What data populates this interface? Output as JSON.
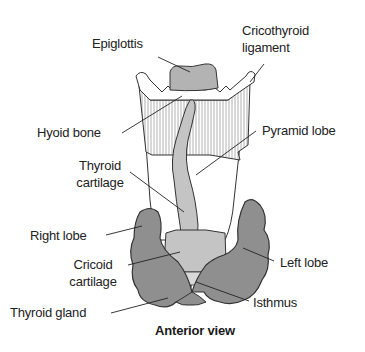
{
  "figure": {
    "view_caption": "Anterior view",
    "colors": {
      "thyroid_gland": "#8f8f8f",
      "cartilage_light": "#c4c4c4",
      "epiglottis": "#b3b3b3",
      "hatching": "#9a9a9a",
      "outline": "#333333",
      "background": "#ffffff"
    }
  },
  "labels": {
    "epiglottis": "Epiglottis",
    "cricothyroid_1": "Cricothyroid",
    "cricothyroid_2": "ligament",
    "hyoid_bone": "Hyoid bone",
    "pyramid_lobe": "Pyramid lobe",
    "thyroid_cartilage_1": "Thyroid",
    "thyroid_cartilage_2": "cartilage",
    "right_lobe": "Right lobe",
    "left_lobe": "Left lobe",
    "cricoid_cartilage_1": "Cricoid",
    "cricoid_cartilage_2": "cartilage",
    "isthmus": "Isthmus",
    "thyroid_gland": "Thyroid gland"
  }
}
